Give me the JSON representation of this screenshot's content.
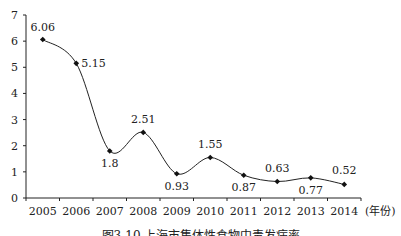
{
  "chart_data": {
    "type": "line",
    "title": "",
    "xlabel": "(年份)",
    "ylabel": "",
    "categories": [
      "2005",
      "2006",
      "2007",
      "2008",
      "2009",
      "2010",
      "2011",
      "2012",
      "2013",
      "2014"
    ],
    "series": [
      {
        "name": "发病率",
        "values": [
          6.06,
          5.15,
          1.8,
          2.51,
          0.93,
          1.55,
          0.87,
          0.63,
          0.77,
          0.52
        ]
      }
    ],
    "data_labels": [
      "6.06",
      "5.15",
      "1.8",
      "2.51",
      "0.93",
      "1.55",
      "0.87",
      "0.63",
      "0.77",
      "0.52"
    ],
    "yticks": [
      "0",
      "1",
      "2",
      "3",
      "4",
      "5",
      "6",
      "7"
    ],
    "ylim": [
      0,
      7
    ],
    "grid": false,
    "smooth": true,
    "marker": "diamond",
    "caption": "图3-10 上海市集体性食物中毒发病率"
  }
}
